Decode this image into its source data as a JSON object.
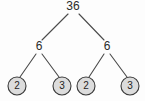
{
  "diagram": {
    "type": "factor-tree",
    "background_color": "#fdfdfd",
    "line_color": "#4a4a4a",
    "circle_fill": "#dcdcdc",
    "circle_stroke": "#3a3a3a",
    "text_color": "#2b2b2b",
    "root": {
      "value": "36",
      "x": 73,
      "y": 7
    },
    "level2": [
      {
        "value": "6",
        "x": 39,
        "y": 47
      },
      {
        "value": "6",
        "x": 107,
        "y": 47
      }
    ],
    "leaves": [
      {
        "value": "2",
        "x": 17,
        "y": 86,
        "r": 9,
        "circled": true
      },
      {
        "value": "3",
        "x": 62,
        "y": 86,
        "r": 9,
        "circled": true
      },
      {
        "value": "2",
        "x": 86,
        "y": 86,
        "r": 9,
        "circled": true
      },
      {
        "value": "3",
        "x": 130,
        "y": 86,
        "r": 9,
        "circled": true
      }
    ],
    "edges": [
      {
        "from": "36",
        "to": "6-left",
        "x1": 68,
        "y1": 14,
        "x2": 42,
        "y2": 40
      },
      {
        "from": "36",
        "to": "6-right",
        "x1": 79,
        "y1": 14,
        "x2": 104,
        "y2": 40
      },
      {
        "from": "6-left",
        "to": "2-a",
        "x1": 36,
        "y1": 54,
        "x2": 20,
        "y2": 77
      },
      {
        "from": "6-left",
        "to": "3-a",
        "x1": 42,
        "y1": 54,
        "x2": 59,
        "y2": 77
      },
      {
        "from": "6-right",
        "to": "2-b",
        "x1": 104,
        "y1": 54,
        "x2": 89,
        "y2": 77
      },
      {
        "from": "6-right",
        "to": "3-b",
        "x1": 110,
        "y1": 54,
        "x2": 127,
        "y2": 77
      }
    ]
  }
}
